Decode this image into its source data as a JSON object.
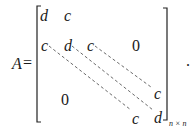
{
  "equation": {
    "lhs": "A",
    "equals": "=",
    "subscript": "n × n",
    "trailing_punct": ".",
    "matrix": {
      "row1": [
        "d",
        "c"
      ],
      "row2": [
        "c",
        "d",
        "c"
      ],
      "upper_zero": "0",
      "lower_zero": "0",
      "row_n_minus_1_last": "c",
      "row_n": [
        "c",
        "d"
      ]
    },
    "diagonals": [
      "sub-diagonal c",
      "main diagonal d",
      "super-diagonal c"
    ]
  }
}
